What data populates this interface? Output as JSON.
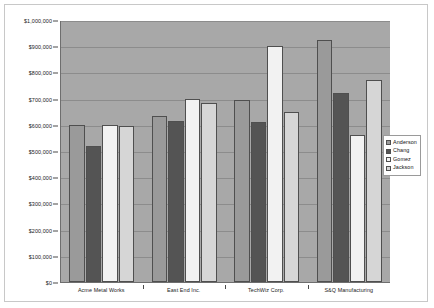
{
  "chart_data": {
    "type": "bar",
    "title": "",
    "xlabel": "",
    "ylabel": "",
    "grid": true,
    "legend_position": "right",
    "ylim": [
      0,
      1000000
    ],
    "categories": [
      "Acme Metal Works",
      "East End Inc.",
      "TechWiz Corp.",
      "S&Q Manufacturing"
    ],
    "ytick_labels": [
      "$1,000,000",
      "$900,000",
      "$800,000",
      "$700,000",
      "$600,000",
      "$500,000",
      "$400,000",
      "$300,000",
      "$200,000",
      "$100,000",
      "$0"
    ],
    "ytick_values": [
      1000000,
      900000,
      800000,
      700000,
      600000,
      500000,
      400000,
      300000,
      200000,
      100000,
      0
    ],
    "series": [
      {
        "name": "Anderson",
        "color": "#9a9a9a",
        "values": [
          600000,
          635000,
          695000,
          925000
        ]
      },
      {
        "name": "Chang",
        "color": "#545454",
        "values": [
          520000,
          615000,
          610000,
          720000
        ]
      },
      {
        "name": "Gomez",
        "color": "#f2f2f2",
        "values": [
          598000,
          700000,
          900000,
          560000
        ]
      },
      {
        "name": "Jackson",
        "color": "#d6d6d6",
        "values": [
          595000,
          685000,
          650000,
          770000
        ]
      }
    ]
  },
  "legend": {
    "entries": [
      {
        "label": "Anderson"
      },
      {
        "label": "Chang"
      },
      {
        "label": "Gomez"
      },
      {
        "label": "Jackson"
      }
    ]
  }
}
